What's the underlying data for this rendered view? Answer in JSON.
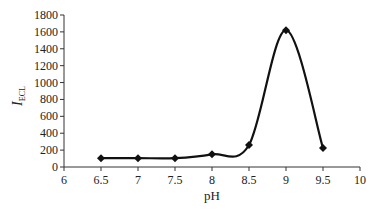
{
  "chart_data": {
    "type": "line",
    "title": "",
    "xlabel": "pH",
    "ylabel": "I",
    "ylabel_subscript": "ECL",
    "x": [
      6.5,
      7,
      7.5,
      8,
      8.5,
      9,
      9.5
    ],
    "series": [
      {
        "name": "I_ECL",
        "values": [
          105,
          105,
          105,
          150,
          260,
          1620,
          225
        ]
      }
    ],
    "xlim": [
      6,
      10
    ],
    "ylim": [
      0,
      1800
    ],
    "x_ticks": [
      "6",
      "6.5",
      "7",
      "7.5",
      "8",
      "8.5",
      "9",
      "9.5",
      "10"
    ],
    "y_ticks": [
      "0",
      "200",
      "400",
      "600",
      "800",
      "1000",
      "1200",
      "1400",
      "1600",
      "1800"
    ],
    "grid": false,
    "legend": "none",
    "marker": "diamond",
    "smooth": true
  },
  "colors": {
    "line": "#111111",
    "axis": "#333333",
    "text": "#222222"
  }
}
